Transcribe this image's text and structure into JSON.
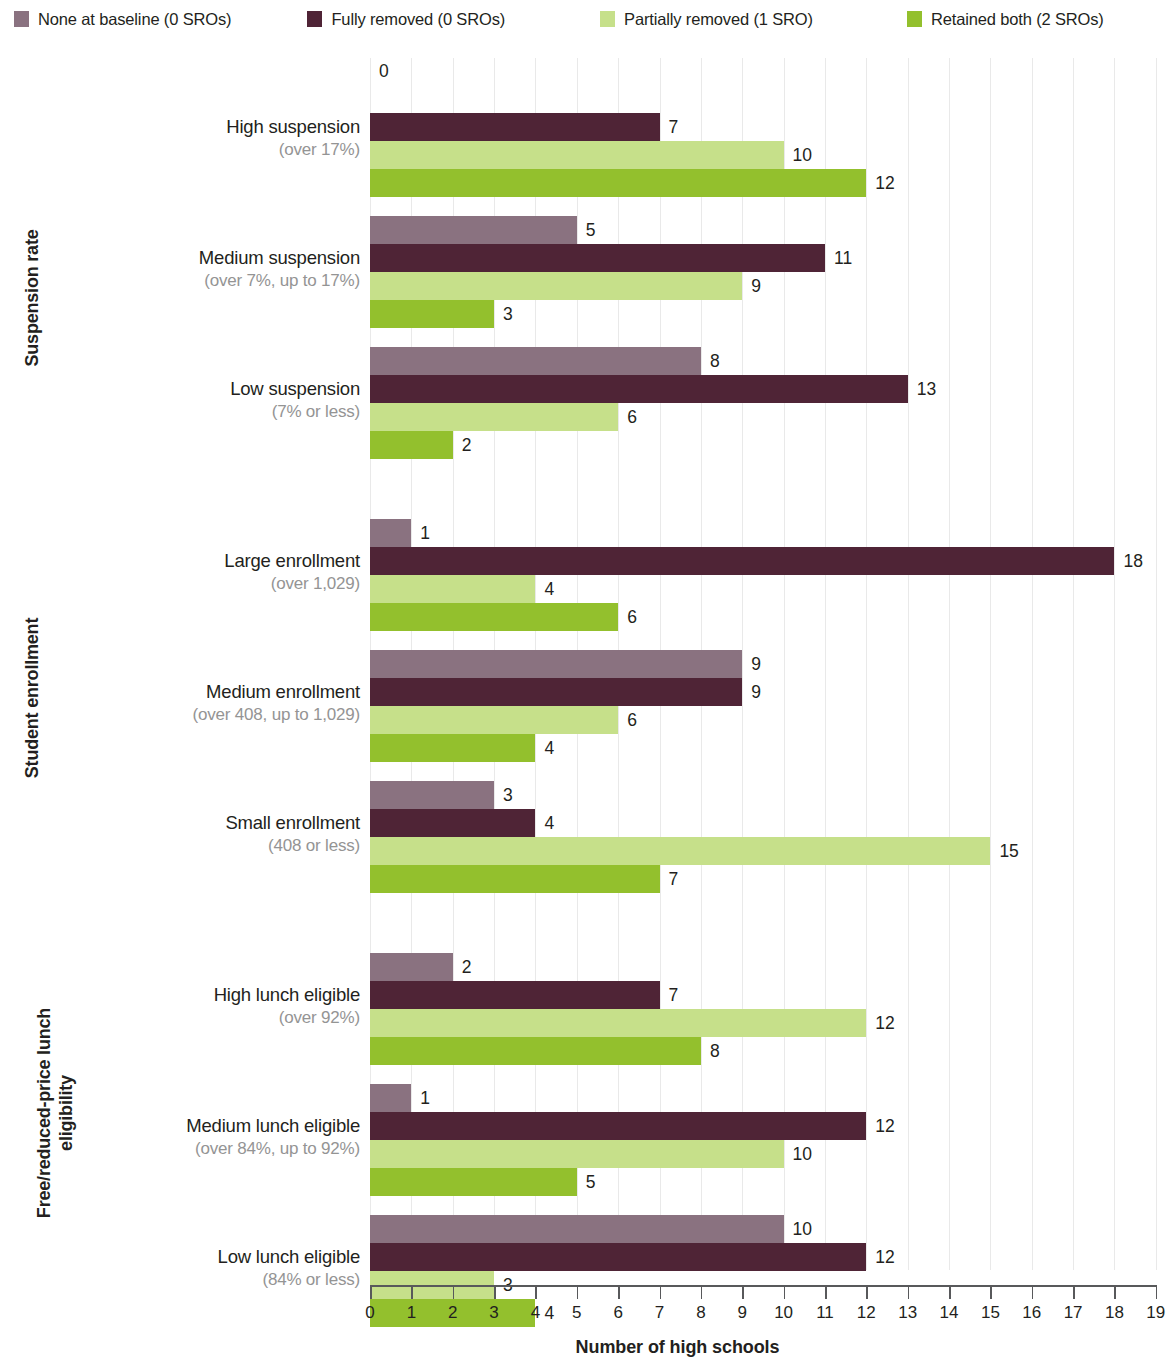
{
  "legend": {
    "items": [
      {
        "label": "None at baseline (0 SROs)",
        "color": "#8a7280"
      },
      {
        "label": "Fully removed (0 SROs)",
        "color": "#4f2436"
      },
      {
        "label": "Partially removed (1 SRO)",
        "color": "#c6e08a"
      },
      {
        "label": "Retained both (2 SROs)",
        "color": "#93c02d"
      }
    ]
  },
  "axis": {
    "x_title": "Number of high schools",
    "x_ticks": [
      0,
      1,
      2,
      3,
      4,
      5,
      6,
      7,
      8,
      9,
      10,
      11,
      12,
      13,
      14,
      15,
      16,
      17,
      18,
      19
    ],
    "x_min": 0,
    "x_max": 19
  },
  "supercategories": [
    {
      "label": "Suspension rate"
    },
    {
      "label": "Student enrollment"
    },
    {
      "label": "Free/reduced-price lunch\neligibility"
    }
  ],
  "chart_data": {
    "type": "bar",
    "orientation": "horizontal",
    "title": "",
    "xlabel": "Number of high schools",
    "ylabel": "",
    "xlim": [
      0,
      19
    ],
    "grid": true,
    "legend_position": "top",
    "series": [
      {
        "name": "None at baseline (0 SROs)",
        "color": "#8a7280",
        "values": [
          0,
          5,
          8,
          1,
          9,
          3,
          2,
          1,
          10
        ]
      },
      {
        "name": "Fully removed (0 SROs)",
        "color": "#4f2436",
        "values": [
          7,
          11,
          13,
          18,
          9,
          4,
          7,
          12,
          12
        ]
      },
      {
        "name": "Partially removed (1 SRO)",
        "color": "#c6e08a",
        "values": [
          10,
          9,
          6,
          4,
          6,
          15,
          12,
          10,
          3
        ]
      },
      {
        "name": "Retained both (2 SROs)",
        "color": "#93c02d",
        "values": [
          12,
          3,
          2,
          6,
          4,
          7,
          8,
          5,
          4
        ]
      }
    ],
    "categories": [
      "High suspension (over 17%)",
      "Medium suspension (over 7%, up to 17%)",
      "Low suspension (7% or less)",
      "Large enrollment (over 1,029)",
      "Medium enrollment (over 408, up to 1,029)",
      "Small enrollment (408 or less)",
      "High lunch eligible (over 92%)",
      "Medium lunch eligible (over 84%, up to 92%)",
      "Low lunch eligible (84% or less)"
    ],
    "groups": [
      {
        "supercategory": "Suspension rate",
        "rows": [
          {
            "main": "High suspension",
            "sub": "(over 17%)",
            "values": [
              0,
              7,
              10,
              12
            ]
          },
          {
            "main": "Medium suspension",
            "sub": "(over 7%, up to 17%)",
            "values": [
              5,
              11,
              9,
              3
            ]
          },
          {
            "main": "Low suspension",
            "sub": "(7% or less)",
            "values": [
              8,
              13,
              6,
              2
            ]
          }
        ]
      },
      {
        "supercategory": "Student enrollment",
        "rows": [
          {
            "main": "Large enrollment",
            "sub": "(over 1,029)",
            "values": [
              1,
              18,
              4,
              6
            ]
          },
          {
            "main": "Medium enrollment",
            "sub": "(over 408, up to 1,029)",
            "values": [
              9,
              9,
              6,
              4
            ]
          },
          {
            "main": "Small enrollment",
            "sub": "(408 or less)",
            "values": [
              3,
              4,
              15,
              7
            ]
          }
        ]
      },
      {
        "supercategory": "Free/reduced-price lunch eligibility",
        "rows": [
          {
            "main": "High lunch eligible",
            "sub": "(over 92%)",
            "values": [
              2,
              7,
              12,
              8
            ]
          },
          {
            "main": "Medium lunch eligible",
            "sub": "(over 84%, up to 92%)",
            "values": [
              1,
              12,
              10,
              5
            ]
          },
          {
            "main": "Low lunch eligible",
            "sub": "(84% or less)",
            "values": [
              10,
              12,
              3,
              4
            ]
          }
        ]
      }
    ]
  }
}
